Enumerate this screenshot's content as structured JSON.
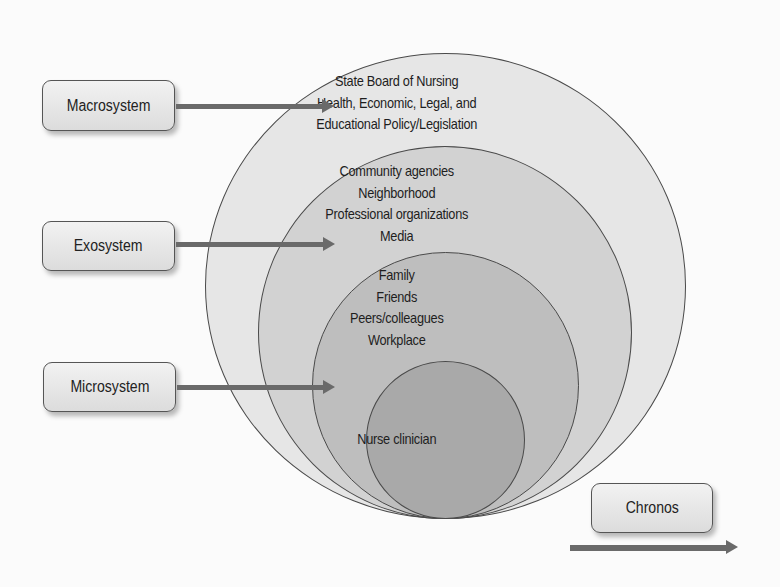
{
  "diagram": {
    "type": "nested-circles-ecological-model",
    "colors": {
      "background": "#fbfbfb",
      "ring_macro": "#e6e6e6",
      "ring_exo": "#d2d2d2",
      "ring_micro": "#bebebe",
      "ring_core": "#a9a9a9",
      "arrow": "#6a6a6a",
      "outline": "#4a4a4a"
    },
    "rings": [
      {
        "name": "macrosystem",
        "lines": [
          "State Board of Nursing",
          "Health, Economic, Legal, and",
          "Educational Policy/Legislation"
        ]
      },
      {
        "name": "exosystem",
        "lines": [
          "Community agencies",
          "Neighborhood",
          "Professional organizations",
          "Media"
        ]
      },
      {
        "name": "microsystem",
        "lines": [
          "Family",
          "Friends",
          "Peers/colleagues",
          "Workplace"
        ]
      },
      {
        "name": "core",
        "lines": [
          "Nurse clinician"
        ]
      }
    ],
    "labels": {
      "macrosystem": "Macrosystem",
      "exosystem": "Exosystem",
      "microsystem": "Microsystem",
      "chronos": "Chronos"
    }
  }
}
